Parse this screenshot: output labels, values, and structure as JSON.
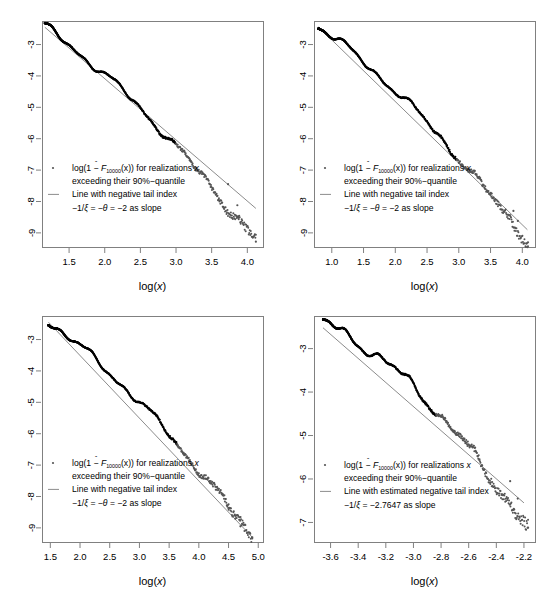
{
  "figure": {
    "layout": "2x2 grid of log-log tail plots",
    "background": "#ffffff",
    "point_color_dense": "#000000",
    "point_color_tail": "#555555",
    "line_color": "#8c8c8c",
    "axis_color": "#808080",
    "text_color": "#000000"
  },
  "chart_data": [
    {
      "id": "panel-top-left",
      "type": "scatter",
      "title": "",
      "xlabel": "log(x)",
      "ylabel": "",
      "xticks": [
        "1.5",
        "2.0",
        "2.5",
        "3.0",
        "3.5",
        "4.0"
      ],
      "xtickvals": [
        1.5,
        2.0,
        2.5,
        3.0,
        3.5,
        4.0
      ],
      "yticks": [
        "-3",
        "-4",
        "-5",
        "-6",
        "-7",
        "-8",
        "-9"
      ],
      "ytickvals": [
        -3,
        -4,
        -5,
        -6,
        -7,
        -8,
        -9
      ],
      "xlim": [
        1.12,
        4.22
      ],
      "ylim": [
        -9.45,
        -2.25
      ],
      "grid": false,
      "legend_position": "bottom-left",
      "legend": [
        {
          "marker": "point",
          "line1_pre": "log(1 − ",
          "line1_sym": "F",
          "line1_hat": "^",
          "line1_sub": "10000",
          "line1_post": "(x)) for realizations ",
          "line1_italic": "x",
          "line2": "exceeding their 90%−quantile"
        },
        {
          "marker": "line",
          "line1": "Line with negative tail index",
          "line2_pre": "−1/",
          "line2_xi": "ξ",
          "line2_mid": " = −",
          "line2_theta": "θ",
          "line2_post": " = −2 as slope"
        }
      ],
      "reference_line": {
        "slope": -2,
        "x0": 1.16,
        "y0": -2.45,
        "x1": 4.12,
        "y1": -8.22
      },
      "series": [
        {
          "name": "empirical-tail",
          "n_points": 1000,
          "x_start": 1.16,
          "x_end": 4.12,
          "y_start": -2.43,
          "y_end": -9.28,
          "dense_fraction": 0.62
        }
      ]
    },
    {
      "id": "panel-top-right",
      "type": "scatter",
      "title": "",
      "xlabel": "log(x)",
      "ylabel": "",
      "xticks": [
        "1.0",
        "1.5",
        "2.0",
        "2.5",
        "3.0",
        "3.5",
        "4.0"
      ],
      "xtickvals": [
        1.0,
        1.5,
        2.0,
        2.5,
        3.0,
        3.5,
        4.0
      ],
      "yticks": [
        "-3",
        "-4",
        "-5",
        "-6",
        "-7",
        "-8",
        "-9"
      ],
      "ytickvals": [
        -3,
        -4,
        -5,
        -6,
        -7,
        -8,
        -9
      ],
      "xlim": [
        0.72,
        4.2
      ],
      "ylim": [
        -9.45,
        -2.25
      ],
      "grid": false,
      "legend_position": "bottom-left",
      "legend": [
        {
          "marker": "point",
          "line1_pre": "log(1 − ",
          "line1_sym": "F",
          "line1_hat": "^",
          "line1_sub": "10000",
          "line1_post": "(x)) for realizations ",
          "line1_italic": "x",
          "line2": "exceeding their 90%−quantile"
        },
        {
          "marker": "line",
          "line1": "Line with negative tail index",
          "line2_pre": "−1/",
          "line2_xi": "ξ",
          "line2_mid": " = −",
          "line2_theta": "θ",
          "line2_post": " = −2 as slope"
        }
      ],
      "reference_line": {
        "slope": -2,
        "x0": 0.79,
        "y0": -2.44,
        "x1": 4.08,
        "y1": -8.9
      },
      "series": [
        {
          "name": "empirical-tail",
          "n_points": 1000,
          "x_start": 0.79,
          "x_end": 4.09,
          "y_start": -2.42,
          "y_end": -9.3,
          "dense_fraction": 0.66
        }
      ]
    },
    {
      "id": "panel-bottom-left",
      "type": "scatter",
      "title": "",
      "xlabel": "log(x)",
      "ylabel": "",
      "xticks": [
        "1.5",
        "2.0",
        "2.5",
        "3.0",
        "3.5",
        "4.0",
        "4.5",
        "5.0"
      ],
      "xtickvals": [
        1.5,
        2.0,
        2.5,
        3.0,
        3.5,
        4.0,
        4.5,
        5.0
      ],
      "yticks": [
        "-3",
        "-4",
        "-5",
        "-6",
        "-7",
        "-8",
        "-9"
      ],
      "ytickvals": [
        -3,
        -4,
        -5,
        -6,
        -7,
        -8,
        -9
      ],
      "xlim": [
        1.36,
        5.08
      ],
      "ylim": [
        -9.45,
        -2.25
      ],
      "grid": false,
      "legend_position": "bottom-left",
      "legend": [
        {
          "marker": "point",
          "line1_pre": "log(1 − ",
          "line1_sym": "F",
          "line1_hat": "^",
          "line1_sub": "10000",
          "line1_post": "(x)) for realizations ",
          "line1_italic": "x",
          "line2": "exceeding their 90%−quantile"
        },
        {
          "marker": "line",
          "line1": "Line with negative tail index",
          "line2_pre": "−1/",
          "line2_xi": "ξ",
          "line2_mid": " = −",
          "line2_theta": "θ",
          "line2_post": " = −2 as slope"
        }
      ],
      "reference_line": {
        "slope": -2,
        "x0": 1.47,
        "y0": -2.45,
        "x1": 4.9,
        "y1": -9.3
      },
      "series": [
        {
          "name": "empirical-tail",
          "n_points": 1000,
          "x_start": 1.47,
          "x_end": 4.9,
          "y_start": -2.43,
          "y_end": -9.3,
          "dense_fraction": 0.63
        }
      ]
    },
    {
      "id": "panel-bottom-right",
      "type": "scatter",
      "title": "",
      "xlabel": "log(x)",
      "ylabel": "",
      "xticks": [
        "-3.6",
        "-3.4",
        "-3.2",
        "-3.0",
        "-2.8",
        "-2.6",
        "-2.4",
        "-2.2"
      ],
      "xtickvals": [
        -3.6,
        -3.4,
        -3.2,
        -3.0,
        -2.8,
        -2.6,
        -2.4,
        -2.2
      ],
      "yticks": [
        "-3",
        "-4",
        "-5",
        "-6",
        "-7"
      ],
      "ytickvals": [
        -3,
        -4,
        -5,
        -6,
        -7
      ],
      "xlim": [
        -3.72,
        -2.12
      ],
      "ylim": [
        -7.45,
        -2.25
      ],
      "grid": false,
      "legend_position": "bottom-left",
      "legend": [
        {
          "marker": "point",
          "line1_pre": "log(1 − ",
          "line1_sym": "F",
          "line1_hat": "^",
          "line1_sub": "10000",
          "line1_post": "(x)) for realizations ",
          "line1_italic": "x",
          "line2": "exceeding their 90%−quantile"
        },
        {
          "marker": "line",
          "line1": "Line with estimated negative tail index",
          "line2_pre": "−1/",
          "line2_xi": "ξ",
          "line2_mid": " = ",
          "line2_theta": "",
          "line2_post": "−2.7647 as slope"
        }
      ],
      "reference_line": {
        "slope": -2.7647,
        "x0": -3.655,
        "y0": -2.52,
        "x1": -2.2,
        "y1": -6.55
      },
      "series": [
        {
          "name": "empirical-tail",
          "n_points": 1000,
          "x_start": -3.655,
          "x_end": -2.17,
          "y_start": -2.4,
          "y_end": -7.15,
          "dense_fraction": 0.55
        }
      ]
    }
  ]
}
